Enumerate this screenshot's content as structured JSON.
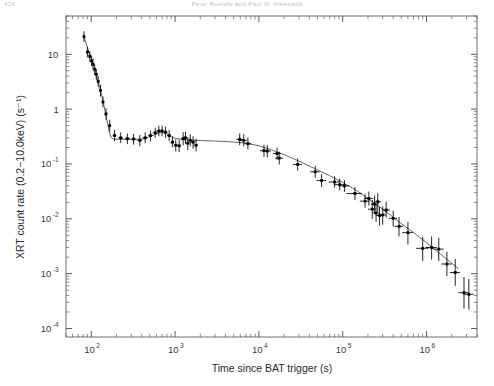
{
  "page": {
    "folio": "424",
    "running_head": "Peter Roelofs and Paul M. Vreeswijk"
  },
  "chart_data": {
    "type": "scatter",
    "title": "",
    "xlabel": "Time since BAT trigger (s)",
    "ylabel": "XRT count rate (0.2−10.0keV) (s⁻¹)",
    "xscale": "log",
    "yscale": "log",
    "xlim": [
      50,
      4000000
    ],
    "ylim": [
      7e-05,
      50
    ],
    "grid": false,
    "legend": null,
    "xticks": [
      {
        "value": 100,
        "label": "10",
        "sup": "2"
      },
      {
        "value": 1000,
        "label": "10",
        "sup": "3"
      },
      {
        "value": 10000,
        "label": "10",
        "sup": "4"
      },
      {
        "value": 100000,
        "label": "10",
        "sup": "5"
      },
      {
        "value": 1000000,
        "label": "10",
        "sup": "6"
      }
    ],
    "yticks": [
      {
        "value": 10,
        "label": "10",
        "sup": ""
      },
      {
        "value": 1,
        "label": "1",
        "sup": ""
      },
      {
        "value": 0.1,
        "label": "10",
        "sup": "-1"
      },
      {
        "value": 0.01,
        "label": "10",
        "sup": "-2"
      },
      {
        "value": 0.001,
        "label": "10",
        "sup": "-3"
      },
      {
        "value": 0.0001,
        "label": "10",
        "sup": "-4"
      }
    ],
    "marker": "cross-point",
    "marker_color": "#000000",
    "line_color": "#555555",
    "series": [
      {
        "name": "XRT light curve",
        "points": [
          {
            "x": 82,
            "y": 21.0,
            "yerr_lo": 4.2,
            "yerr_hi": 5.4,
            "xerr": 2
          },
          {
            "x": 90,
            "y": 11.0,
            "yerr_lo": 2.2,
            "yerr_hi": 2.8,
            "xerr": 2
          },
          {
            "x": 96,
            "y": 9.2,
            "yerr_lo": 1.9,
            "yerr_hi": 2.3,
            "xerr": 2
          },
          {
            "x": 101,
            "y": 7.6,
            "yerr_lo": 1.5,
            "yerr_hi": 1.9,
            "xerr": 2
          },
          {
            "x": 105,
            "y": 6.6,
            "yerr_lo": 1.4,
            "yerr_hi": 1.7,
            "xerr": 2
          },
          {
            "x": 110,
            "y": 5.3,
            "yerr_lo": 1.1,
            "yerr_hi": 1.3,
            "xerr": 2
          },
          {
            "x": 115,
            "y": 4.3,
            "yerr_lo": 0.9,
            "yerr_hi": 1.1,
            "xerr": 2
          },
          {
            "x": 121,
            "y": 3.2,
            "yerr_lo": 0.7,
            "yerr_hi": 0.8,
            "xerr": 3
          },
          {
            "x": 129,
            "y": 2.2,
            "yerr_lo": 0.5,
            "yerr_hi": 0.6,
            "xerr": 3
          },
          {
            "x": 138,
            "y": 1.35,
            "yerr_lo": 0.28,
            "yerr_hi": 0.35,
            "xerr": 4
          },
          {
            "x": 150,
            "y": 0.82,
            "yerr_lo": 0.18,
            "yerr_hi": 0.22,
            "xerr": 5
          },
          {
            "x": 166,
            "y": 0.5,
            "yerr_lo": 0.11,
            "yerr_hi": 0.14,
            "xerr": 6
          },
          {
            "x": 190,
            "y": 0.33,
            "yerr_lo": 0.07,
            "yerr_hi": 0.09,
            "xerr": 10
          },
          {
            "x": 225,
            "y": 0.3,
            "yerr_lo": 0.06,
            "yerr_hi": 0.08,
            "xerr": 14
          },
          {
            "x": 270,
            "y": 0.29,
            "yerr_lo": 0.06,
            "yerr_hi": 0.07,
            "xerr": 18
          },
          {
            "x": 320,
            "y": 0.285,
            "yerr_lo": 0.06,
            "yerr_hi": 0.07,
            "xerr": 22
          },
          {
            "x": 380,
            "y": 0.27,
            "yerr_lo": 0.06,
            "yerr_hi": 0.07,
            "xerr": 26
          },
          {
            "x": 440,
            "y": 0.3,
            "yerr_lo": 0.06,
            "yerr_hi": 0.08,
            "xerr": 30
          },
          {
            "x": 510,
            "y": 0.33,
            "yerr_lo": 0.07,
            "yerr_hi": 0.08,
            "xerr": 34
          },
          {
            "x": 580,
            "y": 0.37,
            "yerr_lo": 0.07,
            "yerr_hi": 0.09,
            "xerr": 38
          },
          {
            "x": 640,
            "y": 0.4,
            "yerr_lo": 0.08,
            "yerr_hi": 0.1,
            "xerr": 40
          },
          {
            "x": 700,
            "y": 0.4,
            "yerr_lo": 0.08,
            "yerr_hi": 0.1,
            "xerr": 42
          },
          {
            "x": 770,
            "y": 0.38,
            "yerr_lo": 0.08,
            "yerr_hi": 0.1,
            "xerr": 45
          },
          {
            "x": 850,
            "y": 0.33,
            "yerr_lo": 0.07,
            "yerr_hi": 0.09,
            "xerr": 48
          },
          {
            "x": 930,
            "y": 0.25,
            "yerr_lo": 0.05,
            "yerr_hi": 0.07,
            "xerr": 50
          },
          {
            "x": 1020,
            "y": 0.22,
            "yerr_lo": 0.05,
            "yerr_hi": 0.06,
            "xerr": 55
          },
          {
            "x": 1120,
            "y": 0.215,
            "yerr_lo": 0.05,
            "yerr_hi": 0.06,
            "xerr": 60
          },
          {
            "x": 1250,
            "y": 0.29,
            "yerr_lo": 0.07,
            "yerr_hi": 0.09,
            "xerr": 70
          },
          {
            "x": 1330,
            "y": 0.3,
            "yerr_lo": 0.07,
            "yerr_hi": 0.09,
            "xerr": 70
          },
          {
            "x": 1420,
            "y": 0.24,
            "yerr_lo": 0.06,
            "yerr_hi": 0.07,
            "xerr": 75
          },
          {
            "x": 1520,
            "y": 0.27,
            "yerr_lo": 0.06,
            "yerr_hi": 0.08,
            "xerr": 80
          },
          {
            "x": 1640,
            "y": 0.25,
            "yerr_lo": 0.06,
            "yerr_hi": 0.07,
            "xerr": 85
          },
          {
            "x": 1780,
            "y": 0.22,
            "yerr_lo": 0.05,
            "yerr_hi": 0.07,
            "xerr": 90
          },
          {
            "x": 5900,
            "y": 0.28,
            "yerr_lo": 0.06,
            "yerr_hi": 0.08,
            "xerr": 500
          },
          {
            "x": 6600,
            "y": 0.27,
            "yerr_lo": 0.06,
            "yerr_hi": 0.08,
            "xerr": 600
          },
          {
            "x": 7400,
            "y": 0.235,
            "yerr_lo": 0.05,
            "yerr_hi": 0.07,
            "xerr": 700
          },
          {
            "x": 11500,
            "y": 0.175,
            "yerr_lo": 0.04,
            "yerr_hi": 0.05,
            "xerr": 1200
          },
          {
            "x": 12600,
            "y": 0.172,
            "yerr_lo": 0.04,
            "yerr_hi": 0.05,
            "xerr": 1300
          },
          {
            "x": 16500,
            "y": 0.155,
            "yerr_lo": 0.035,
            "yerr_hi": 0.045,
            "xerr": 1800
          },
          {
            "x": 17500,
            "y": 0.128,
            "yerr_lo": 0.03,
            "yerr_hi": 0.04,
            "xerr": 1900
          },
          {
            "x": 29000,
            "y": 0.098,
            "yerr_lo": 0.022,
            "yerr_hi": 0.028,
            "xerr": 3500
          },
          {
            "x": 47000,
            "y": 0.072,
            "yerr_lo": 0.016,
            "yerr_hi": 0.021,
            "xerr": 6000
          },
          {
            "x": 56000,
            "y": 0.05,
            "yerr_lo": 0.012,
            "yerr_hi": 0.015,
            "xerr": 7000
          },
          {
            "x": 80000,
            "y": 0.047,
            "yerr_lo": 0.01,
            "yerr_hi": 0.013,
            "xerr": 12000
          },
          {
            "x": 92000,
            "y": 0.042,
            "yerr_lo": 0.009,
            "yerr_hi": 0.012,
            "xerr": 14000
          },
          {
            "x": 105000,
            "y": 0.04,
            "yerr_lo": 0.009,
            "yerr_hi": 0.011,
            "xerr": 15000
          },
          {
            "x": 140000,
            "y": 0.029,
            "yerr_lo": 0.007,
            "yerr_hi": 0.009,
            "xerr": 30000
          },
          {
            "x": 185000,
            "y": 0.021,
            "yerr_lo": 0.005,
            "yerr_hi": 0.007,
            "xerr": 25000
          },
          {
            "x": 205000,
            "y": 0.0235,
            "yerr_lo": 0.006,
            "yerr_hi": 0.008,
            "xerr": 25000
          },
          {
            "x": 225000,
            "y": 0.015,
            "yerr_lo": 0.005,
            "yerr_hi": 0.007,
            "xerr": 25000
          },
          {
            "x": 240000,
            "y": 0.0185,
            "yerr_lo": 0.006,
            "yerr_hi": 0.008,
            "xerr": 25000
          },
          {
            "x": 250000,
            "y": 0.0128,
            "yerr_lo": 0.004,
            "yerr_hi": 0.006,
            "xerr": 25000
          },
          {
            "x": 262000,
            "y": 0.0205,
            "yerr_lo": 0.007,
            "yerr_hi": 0.009,
            "xerr": 25000
          },
          {
            "x": 275000,
            "y": 0.0115,
            "yerr_lo": 0.004,
            "yerr_hi": 0.005,
            "xerr": 25000
          },
          {
            "x": 300000,
            "y": 0.0118,
            "yerr_lo": 0.004,
            "yerr_hi": 0.005,
            "xerr": 30000
          },
          {
            "x": 330000,
            "y": 0.0145,
            "yerr_lo": 0.004,
            "yerr_hi": 0.006,
            "xerr": 35000
          },
          {
            "x": 400000,
            "y": 0.0102,
            "yerr_lo": 0.003,
            "yerr_hi": 0.004,
            "xerr": 45000
          },
          {
            "x": 470000,
            "y": 0.0073,
            "yerr_lo": 0.0025,
            "yerr_hi": 0.0035,
            "xerr": 55000
          },
          {
            "x": 600000,
            "y": 0.0056,
            "yerr_lo": 0.0022,
            "yerr_hi": 0.0032,
            "xerr": 90000
          },
          {
            "x": 900000,
            "y": 0.0029,
            "yerr_lo": 0.0012,
            "yerr_hi": 0.0018,
            "xerr": 150000
          },
          {
            "x": 1150000,
            "y": 0.003,
            "yerr_lo": 0.0012,
            "yerr_hi": 0.0018,
            "xerr": 180000
          },
          {
            "x": 1400000,
            "y": 0.0028,
            "yerr_lo": 0.0011,
            "yerr_hi": 0.0017,
            "xerr": 200000
          },
          {
            "x": 1750000,
            "y": 0.0015,
            "yerr_lo": 0.0006,
            "yerr_hi": 0.001,
            "xerr": 250000
          },
          {
            "x": 2200000,
            "y": 0.00105,
            "yerr_lo": 0.00045,
            "yerr_hi": 0.0008,
            "xerr": 300000
          },
          {
            "x": 2800000,
            "y": 0.00045,
            "yerr_lo": 0.00022,
            "yerr_hi": 0.00042,
            "xerr": 400000
          },
          {
            "x": 3200000,
            "y": 0.00042,
            "yerr_lo": 0.0002,
            "yerr_hi": 0.00038,
            "xerr": 450000
          }
        ]
      }
    ],
    "fit_curve": {
      "name": "broken power-law fit",
      "points": [
        {
          "x": 80,
          "y": 23.0
        },
        {
          "x": 95,
          "y": 10.5
        },
        {
          "x": 110,
          "y": 5.4
        },
        {
          "x": 125,
          "y": 2.7
        },
        {
          "x": 140,
          "y": 1.3
        },
        {
          "x": 152,
          "y": 0.7
        },
        {
          "x": 162,
          "y": 0.42
        },
        {
          "x": 172,
          "y": 0.305
        },
        {
          "x": 185,
          "y": 0.285
        },
        {
          "x": 230,
          "y": 0.283
        },
        {
          "x": 300,
          "y": 0.28
        },
        {
          "x": 400,
          "y": 0.285
        },
        {
          "x": 500,
          "y": 0.315
        },
        {
          "x": 600,
          "y": 0.355
        },
        {
          "x": 700,
          "y": 0.375
        },
        {
          "x": 800,
          "y": 0.355
        },
        {
          "x": 900,
          "y": 0.32
        },
        {
          "x": 1000,
          "y": 0.295
        },
        {
          "x": 1200,
          "y": 0.28
        },
        {
          "x": 1500,
          "y": 0.272
        },
        {
          "x": 2000,
          "y": 0.268
        },
        {
          "x": 3000,
          "y": 0.262
        },
        {
          "x": 5000,
          "y": 0.252
        },
        {
          "x": 7000,
          "y": 0.24
        },
        {
          "x": 10000,
          "y": 0.215
        },
        {
          "x": 15000,
          "y": 0.175
        },
        {
          "x": 20000,
          "y": 0.148
        },
        {
          "x": 30000,
          "y": 0.113
        },
        {
          "x": 50000,
          "y": 0.078
        },
        {
          "x": 70000,
          "y": 0.061
        },
        {
          "x": 100000,
          "y": 0.046
        },
        {
          "x": 150000,
          "y": 0.032
        },
        {
          "x": 200000,
          "y": 0.0235
        },
        {
          "x": 300000,
          "y": 0.015
        },
        {
          "x": 500000,
          "y": 0.0082
        },
        {
          "x": 700000,
          "y": 0.0056
        },
        {
          "x": 1000000,
          "y": 0.0037
        },
        {
          "x": 1500000,
          "y": 0.0022
        },
        {
          "x": 2000000,
          "y": 0.00155
        },
        {
          "x": 2400000,
          "y": 0.00125
        }
      ]
    }
  }
}
